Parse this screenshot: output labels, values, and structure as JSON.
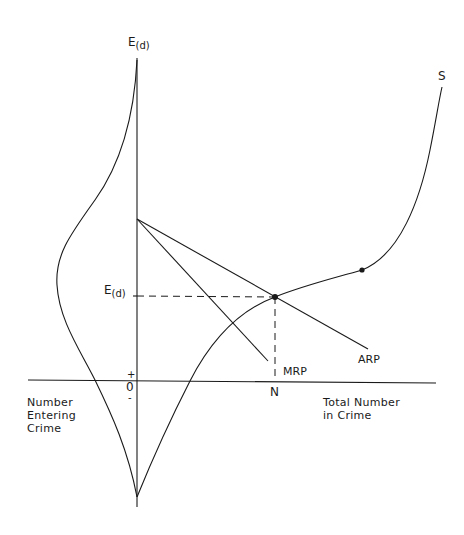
{
  "diagram": {
    "vertical_axis_label": {
      "main": "E",
      "sub": "(d)"
    },
    "ed_tick_label": {
      "main": "E",
      "sub": "(d)"
    },
    "origin": {
      "plus": "+",
      "zero": "0",
      "minus": "-"
    },
    "left_axis_caption": "Number\nEntering\nCrime",
    "right_axis_caption": "Total Number\nin Crime",
    "n_label": "N",
    "curves": {
      "s_label": "S",
      "mrp_label": "MRP",
      "arp_label": "ARP"
    },
    "points": [
      {
        "name": "equilibrium",
        "x": 275,
        "y": 297
      },
      {
        "name": "inflection",
        "x": 362,
        "y": 270
      }
    ],
    "colors": {
      "ink": "#1a1a1a",
      "background": "#ffffff"
    }
  }
}
